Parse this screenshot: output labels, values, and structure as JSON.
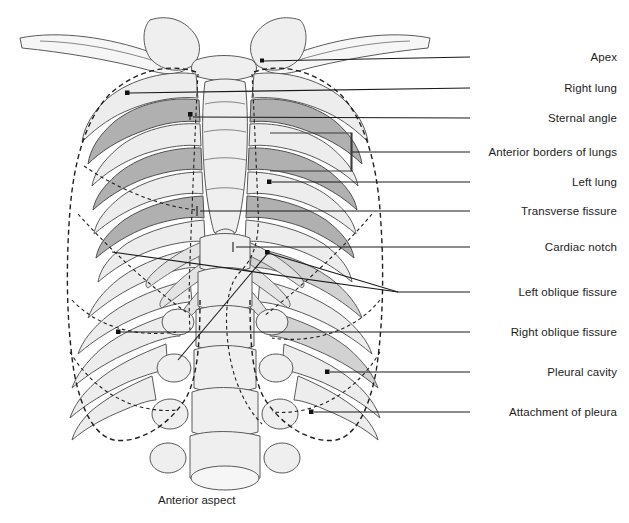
{
  "figure": {
    "caption": "Anterior aspect",
    "colors": {
      "rib_light": "#e8e8e8",
      "rib_mid": "#cfcfcf",
      "rib_dark": "#a8a8a8",
      "outline": "#4a4a4a",
      "leader": "#1a1a1a",
      "background": "#ffffff"
    }
  },
  "labels": [
    {
      "id": "apex",
      "text": "Apex",
      "y": 57,
      "line_x1": 338,
      "line_y1": 57,
      "dot_x": 260,
      "dot_y": 61,
      "kink_x": 470,
      "leader": "straight"
    },
    {
      "id": "right-lung",
      "text": "Right lung",
      "y": 88,
      "line_x1": 260,
      "line_y1": 88,
      "dot_x": 126,
      "dot_y": 93,
      "kink_x": 470,
      "leader": "straight"
    },
    {
      "id": "sternal-angle",
      "text": "Sternal angle",
      "y": 118,
      "line_x1": 228,
      "line_y1": 118,
      "dot_x": 189,
      "dot_y": 114,
      "kink_x": 470,
      "leader": "straight"
    },
    {
      "id": "anterior-borders",
      "text": "Anterior borders of lungs",
      "y": 152,
      "line_x1": 420,
      "line_y1": 152,
      "dot_x": 0,
      "dot_y": 0,
      "kink_x": 470,
      "leader": "bracket"
    },
    {
      "id": "left-lung",
      "text": "Left lung",
      "y": 182,
      "line_x1": 268,
      "line_y1": 182,
      "dot_x": 268,
      "dot_y": 182,
      "kink_x": 470,
      "leader": "straight"
    },
    {
      "id": "transverse-fissure",
      "text": "Transverse fissure",
      "y": 211,
      "line_x1": 196,
      "line_y1": 211,
      "dot_x": 196,
      "dot_y": 211,
      "kink_x": 470,
      "leader": "straight"
    },
    {
      "id": "cardiac-notch",
      "text": "Cardiac notch",
      "y": 247,
      "line_x1": 232,
      "line_y1": 247,
      "dot_x": 232,
      "dot_y": 247,
      "kink_x": 470,
      "leader": "straight"
    },
    {
      "id": "left-oblique-fissure",
      "text": "Left oblique fissure",
      "y": 292,
      "line_x1": 265,
      "line_y1": 292,
      "dot_x": 265,
      "dot_y": 252,
      "kink_x": 470,
      "leader": "diagonal"
    },
    {
      "id": "right-oblique-fissure",
      "text": "Right oblique fissure",
      "y": 332,
      "line_x1": 117,
      "line_y1": 332,
      "dot_x": 117,
      "dot_y": 252,
      "kink_x": 470,
      "leader": "straight"
    },
    {
      "id": "pleural-cavity",
      "text": "Pleural cavity",
      "y": 372,
      "line_x1": 326,
      "line_y1": 372,
      "dot_x": 326,
      "dot_y": 372,
      "kink_x": 470,
      "leader": "straight"
    },
    {
      "id": "attachment-of-pleura",
      "text": "Attachment of pleura",
      "y": 412,
      "line_x1": 310,
      "line_y1": 412,
      "dot_x": 310,
      "dot_y": 412,
      "kink_x": 470,
      "leader": "straight"
    }
  ],
  "label_right_edge": 617,
  "caption": {
    "text": "Anterior aspect",
    "x": 158,
    "y": 494
  },
  "credit": {
    "text": "",
    "x": 10,
    "y": 514
  }
}
